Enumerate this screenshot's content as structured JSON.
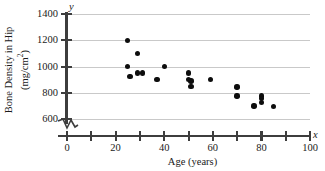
{
  "chart_data": {
    "type": "scatter",
    "title": "",
    "xlabel": "Age (years)",
    "ylabel": "Bone Density in Hip (mg/cm²)",
    "ylabel_line1": "Bone Density in Hip",
    "ylabel_line2_prefix": "(mg/cm",
    "ylabel_line2_sup": "2",
    "ylabel_line2_suffix": ")",
    "x_axis_symbol": "x",
    "y_axis_symbol": "y",
    "xlim": [
      0,
      100
    ],
    "ylim": [
      600,
      1400
    ],
    "y_axis_has_break": true,
    "grid": "horizontal",
    "legend": "none",
    "xticks": [
      0,
      10,
      20,
      30,
      40,
      50,
      60,
      70,
      80,
      90,
      100
    ],
    "xtick_labels": [
      "0",
      "",
      "20",
      "",
      "40",
      "",
      "60",
      "",
      "80",
      "",
      "100"
    ],
    "yticks": [
      600,
      800,
      1000,
      1200,
      1400
    ],
    "ytick_labels": [
      "600",
      "800",
      "1000",
      "1200",
      "1400"
    ],
    "points": [
      {
        "x": 25,
        "y": 1200
      },
      {
        "x": 25,
        "y": 1000
      },
      {
        "x": 26,
        "y": 925
      },
      {
        "x": 29,
        "y": 1100
      },
      {
        "x": 29,
        "y": 950
      },
      {
        "x": 31,
        "y": 950
      },
      {
        "x": 37,
        "y": 900
      },
      {
        "x": 40,
        "y": 1000
      },
      {
        "x": 50,
        "y": 950
      },
      {
        "x": 50,
        "y": 900
      },
      {
        "x": 51,
        "y": 890
      },
      {
        "x": 51,
        "y": 850
      },
      {
        "x": 59,
        "y": 900
      },
      {
        "x": 70,
        "y": 845
      },
      {
        "x": 70,
        "y": 775
      },
      {
        "x": 77,
        "y": 700
      },
      {
        "x": 80,
        "y": 775
      },
      {
        "x": 80,
        "y": 755
      },
      {
        "x": 80,
        "y": 725
      },
      {
        "x": 85,
        "y": 695
      }
    ],
    "colors": {
      "point": "#0d0d0d",
      "axis": "#3d3d3d",
      "grid": "#c9c9c9",
      "background": "#ffffff"
    }
  }
}
